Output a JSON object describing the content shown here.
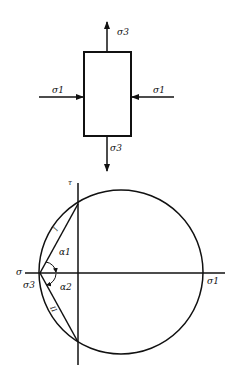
{
  "stress_element": {
    "top_label": "σ3",
    "bottom_label": "σ3",
    "left_label": "σ1",
    "right_label": "σ1"
  },
  "mohr_diagram": {
    "tau_axis_label": "τ",
    "sigma_axis_label": "σ",
    "sigma1_label": "σ1",
    "sigma3_label": "σ3",
    "alpha1_label": "α1",
    "alpha2_label": "α2",
    "line1_label": "I",
    "line2_label": "II"
  },
  "colors": {
    "stroke": "#111111",
    "background": "#ffffff"
  }
}
